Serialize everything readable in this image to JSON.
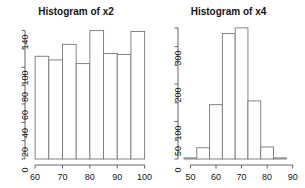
{
  "figure": {
    "background": "#ffffff",
    "axis_color": "#555555",
    "bar_border_color": "#777777",
    "bar_fill": "#ffffff",
    "text_color": "#151515"
  },
  "chart_data": [
    {
      "type": "bar",
      "title": "Histogram of x2",
      "xlabel": "",
      "ylabel": "",
      "grid": false,
      "legend": "none",
      "xlim": [
        58.5,
        100.5
      ],
      "ylim": [
        0,
        145
      ],
      "xticks": [
        60,
        70,
        80,
        90,
        100
      ],
      "xticklabels": [
        "60",
        "70",
        "80",
        "90",
        "100"
      ],
      "yticks": [
        0,
        20,
        40,
        60,
        80,
        100,
        120,
        140
      ],
      "yticklabels": [
        "0",
        "20",
        "40",
        "60",
        "80",
        "100",
        "",
        "140"
      ],
      "bin_edges": [
        60,
        65,
        70,
        75,
        80,
        85,
        90,
        95,
        100
      ],
      "values": [
        112,
        108,
        125,
        104,
        140,
        115,
        114,
        139
      ]
    },
    {
      "type": "bar",
      "title": "Histogram of x4",
      "xlabel": "",
      "ylabel": "",
      "grid": false,
      "legend": "none",
      "xlim": [
        47.5,
        90.5
      ],
      "ylim": [
        0,
        355
      ],
      "xticks": [
        50,
        60,
        70,
        80,
        90
      ],
      "xticklabels": [
        "50",
        "60",
        "70",
        "80",
        "90"
      ],
      "yticks": [
        0,
        50,
        100,
        150,
        200,
        250,
        300,
        350
      ],
      "yticklabels": [
        "0",
        "50",
        "100",
        "",
        "200",
        "",
        "300",
        ""
      ],
      "bin_edges": [
        47.5,
        52.5,
        57.5,
        62.5,
        67.5,
        72.5,
        77.5,
        82.5,
        87.5
      ],
      "values": [
        3,
        30,
        145,
        335,
        350,
        155,
        32,
        3
      ]
    }
  ]
}
